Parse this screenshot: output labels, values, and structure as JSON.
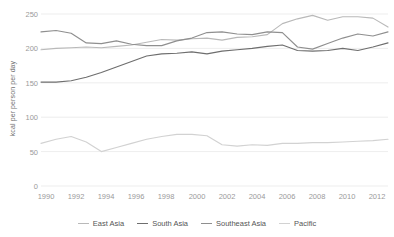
{
  "figure": {
    "cropped_title": "",
    "background": "#ffffff"
  },
  "axis": {
    "ylabel": "kcal per person per day",
    "yticks": [
      "0",
      "50",
      "100",
      "150",
      "200",
      "250"
    ],
    "xticks": [
      "1990",
      "1992",
      "1994",
      "1996",
      "1998",
      "2000",
      "2002",
      "2004",
      "2006",
      "2008",
      "2010",
      "2012"
    ]
  },
  "legend": {
    "items": [
      {
        "label": "East Asia",
        "color": "#b9b9b9"
      },
      {
        "label": "South Asia",
        "color": "#6e6e6e"
      },
      {
        "label": "Southeast Asia",
        "color": "#8f8f8f"
      },
      {
        "label": "Pacific",
        "color": "#d2d2d2"
      }
    ]
  },
  "chart_data": {
    "type": "line",
    "title": "",
    "xlabel": "",
    "ylabel": "kcal per person per day",
    "xlim": [
      1990,
      2013
    ],
    "ylim": [
      0,
      250
    ],
    "grid": true,
    "legend_position": "bottom",
    "x": [
      1990,
      1991,
      1992,
      1993,
      1994,
      1995,
      1996,
      1997,
      1998,
      1999,
      2000,
      2001,
      2002,
      2003,
      2004,
      2005,
      2006,
      2007,
      2008,
      2009,
      2010,
      2011,
      2012,
      2013
    ],
    "series": [
      {
        "name": "East Asia",
        "color": "#b9b9b9",
        "values": [
          198,
          200,
          201,
          202,
          201,
          203,
          205,
          209,
          213,
          212,
          214,
          215,
          212,
          216,
          217,
          220,
          236,
          243,
          248,
          241,
          246,
          246,
          244,
          231
        ]
      },
      {
        "name": "South Asia",
        "color": "#6e6e6e",
        "values": [
          151,
          151,
          153,
          158,
          165,
          173,
          181,
          189,
          192,
          193,
          195,
          192,
          196,
          198,
          200,
          203,
          205,
          197,
          196,
          197,
          200,
          197,
          202,
          208
        ]
      },
      {
        "name": "Southeast Asia",
        "color": "#8f8f8f",
        "values": [
          224,
          226,
          222,
          208,
          207,
          211,
          206,
          204,
          204,
          211,
          215,
          223,
          224,
          221,
          220,
          224,
          223,
          202,
          199,
          207,
          215,
          221,
          218,
          224
        ]
      },
      {
        "name": "Pacific",
        "color": "#d2d2d2",
        "values": [
          62,
          68,
          72,
          64,
          50,
          56,
          62,
          68,
          72,
          75,
          75,
          73,
          60,
          58,
          60,
          59,
          62,
          62,
          63,
          63,
          64,
          65,
          66,
          68
        ]
      }
    ]
  }
}
